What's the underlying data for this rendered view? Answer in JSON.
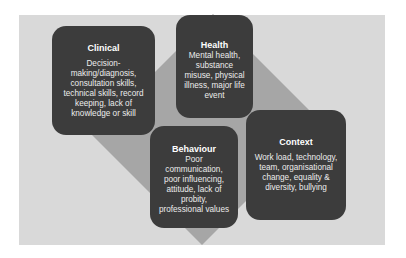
{
  "diagram": {
    "colors": {
      "background": "#ffffff",
      "panel": "#d9d9d9",
      "diamond": "#a6a6a6",
      "box_fill": "#3c3c3c",
      "box_text": "#f2f2f2"
    },
    "diamond": {
      "shape": "rotated-square",
      "points": "213,14 323,124 202,245 92,135"
    },
    "boxes": [
      {
        "id": "clinical",
        "title": "Clinical",
        "body": "Decision-making/diagnosis, consultation skills, technical skills, record keeping, lack of knowledge or skill",
        "lines": [
          "Decision-",
          "making/diagnosis,",
          "consultation skills,",
          "technical skills, record",
          "keeping, lack of",
          "knowledge or skill"
        ]
      },
      {
        "id": "health",
        "title": "Health",
        "body": "Mental health, substance misuse, physical illness, major life event",
        "lines": [
          "Mental health,",
          "substance",
          "misuse, physical",
          "illness, major life",
          "event"
        ]
      },
      {
        "id": "behaviour",
        "title": "Behaviour",
        "body": "Poor communication, poor influencing, attitude, lack of probity, professional values",
        "lines": [
          "Poor",
          "communication,",
          "poor influencing,",
          "attitude, lack of",
          "probity,",
          "professional values"
        ]
      },
      {
        "id": "context",
        "title": "Context",
        "body": "Work load, technology, team, organisational change, equality & diversity, bullying",
        "lines": [
          "Work load, technology,",
          "team, organisational",
          "change, equality &",
          "diversity, bullying"
        ]
      }
    ]
  }
}
